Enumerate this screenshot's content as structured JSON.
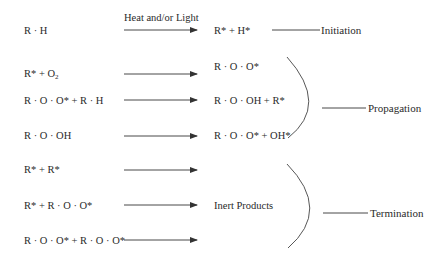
{
  "diagram": {
    "arrow_label": "Heat and/or Light",
    "reactions": [
      {
        "id": "r1",
        "reactants": "R · H",
        "products": "R* + H*",
        "stage": "Initiation"
      },
      {
        "id": "r2",
        "reactants": "R* + O",
        "reactants_sub": "2",
        "products": "R · O · O*",
        "stage": "Propagation"
      },
      {
        "id": "r3",
        "reactants": "R · O · O* + R · H",
        "products": "R · O · OH + R*",
        "stage": "Propagation"
      },
      {
        "id": "r4",
        "reactants": "R · O · OH",
        "products": "R · O · O* + OH*",
        "stage": "Propagation"
      },
      {
        "id": "r5",
        "reactants": "R* + R*",
        "products": "",
        "stage": "Termination"
      },
      {
        "id": "r6",
        "reactants": "R* + R · O · O*",
        "products": "Inert Products",
        "stage": "Termination"
      },
      {
        "id": "r7",
        "reactants": "R · O · O* + R · O · O*",
        "products": "",
        "stage": "Termination"
      }
    ],
    "stages": {
      "initiation": "Initiation",
      "propagation": "Propagation",
      "termination": "Termination"
    },
    "colors": {
      "text": "#2a2a2a",
      "line": "#333333",
      "background": "#ffffff"
    }
  }
}
